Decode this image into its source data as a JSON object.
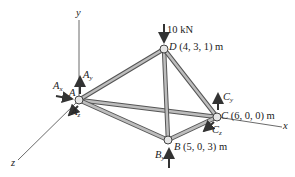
{
  "diagram": {
    "type": "3D space truss free-body diagram",
    "axes": {
      "x": "x",
      "y": "y",
      "z": "z"
    },
    "load": {
      "label": "10 kN",
      "point": "D",
      "direction": "down"
    },
    "joints": [
      {
        "id": "A",
        "label": "A",
        "coords": ""
      },
      {
        "id": "B",
        "label": "B",
        "coords": "(5, 0, 3) m"
      },
      {
        "id": "C",
        "label": "C",
        "coords": "(6, 0, 0) m"
      },
      {
        "id": "D",
        "label": "D",
        "coords": "(4, 3, 1) m"
      }
    ],
    "members": [
      "AD",
      "AB",
      "AC",
      "BD",
      "CD",
      "BC"
    ],
    "reactions": {
      "Ax": {
        "base": "A",
        "sub": "x"
      },
      "Ay": {
        "base": "A",
        "sub": "y"
      },
      "Az": {
        "base": "A",
        "sub": "z"
      },
      "By": {
        "base": "B",
        "sub": "y"
      },
      "Cy": {
        "base": "C",
        "sub": "y"
      },
      "Cz": {
        "base": "C",
        "sub": "z"
      }
    },
    "colors": {
      "member": "#9a9a9a",
      "member_edge": "#555555",
      "arrow": "#333333",
      "axis": "#444444",
      "text": "#222222"
    }
  }
}
